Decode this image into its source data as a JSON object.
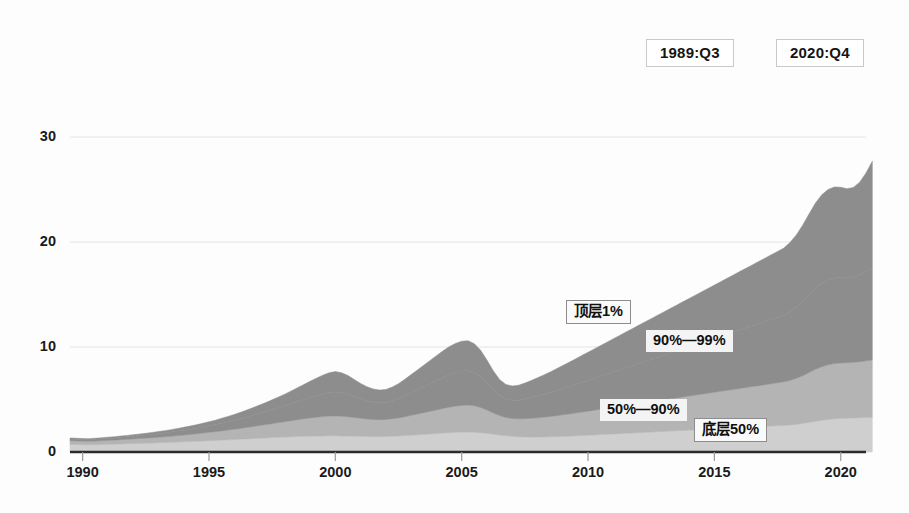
{
  "annotations": {
    "start_date": "1989:Q3",
    "end_date": "2020:Q4"
  },
  "chart_data": {
    "type": "area",
    "stacked": true,
    "title": "",
    "subtitle": "",
    "xlabel": "",
    "ylabel": "",
    "xlim": [
      1989.5,
      2021.0
    ],
    "ylim": [
      0,
      34
    ],
    "yticks": [
      0,
      10,
      20,
      30
    ],
    "ytick_labels": [
      "0",
      "10",
      "20",
      "30"
    ],
    "xticks": [
      1990,
      1995,
      2000,
      2005,
      2010,
      2015,
      2020
    ],
    "xtick_labels": [
      "1990",
      "1995",
      "2000",
      "2005",
      "2010",
      "2015",
      "2020"
    ],
    "grid": "horizontal",
    "legend_position": "inline-annotations",
    "colors": {
      "top_1": "#8d8d8d",
      "p90_99": "#8d8d8d",
      "p50_90": "#b4b4b4",
      "bottom_50": "#cfcfcf",
      "axis": "#2b2b2b",
      "grid": "#e4e4e4",
      "text": "#141414",
      "background": "#fdfdfd"
    },
    "series": [
      {
        "name": "底层50%",
        "name_en": "Bottom 50%",
        "color": "#cfcfcf",
        "label": "底层50%",
        "values": [
          0.72,
          0.71,
          0.7,
          0.69,
          0.7,
          0.72,
          0.74,
          0.75,
          0.77,
          0.79,
          0.81,
          0.82,
          0.84,
          0.86,
          0.88,
          0.9,
          0.92,
          0.95,
          0.97,
          1.0,
          1.02,
          1.05,
          1.08,
          1.1,
          1.13,
          1.16,
          1.19,
          1.22,
          1.25,
          1.28,
          1.31,
          1.34,
          1.37,
          1.4,
          1.42,
          1.45,
          1.47,
          1.49,
          1.51,
          1.52,
          1.53,
          1.54,
          1.54,
          1.53,
          1.52,
          1.5,
          1.49,
          1.48,
          1.47,
          1.47,
          1.48,
          1.5,
          1.53,
          1.56,
          1.6,
          1.64,
          1.68,
          1.72,
          1.76,
          1.8,
          1.84,
          1.87,
          1.89,
          1.9,
          1.88,
          1.84,
          1.78,
          1.7,
          1.62,
          1.55,
          1.5,
          1.46,
          1.44,
          1.43,
          1.43,
          1.44,
          1.45,
          1.47,
          1.49,
          1.51,
          1.54,
          1.57,
          1.6,
          1.63,
          1.66,
          1.69,
          1.72,
          1.75,
          1.78,
          1.81,
          1.84,
          1.87,
          1.9,
          1.93,
          1.96,
          1.99,
          2.02,
          2.05,
          2.08,
          2.11,
          2.14,
          2.17,
          2.2,
          2.23,
          2.26,
          2.29,
          2.32,
          2.35,
          2.38,
          2.41,
          2.44,
          2.47,
          2.5,
          2.53,
          2.58,
          2.64,
          2.72,
          2.82,
          2.92,
          3.02,
          3.1,
          3.16,
          3.2,
          3.22,
          3.24,
          3.26,
          3.28,
          3.3
        ]
      },
      {
        "name": "50%—90%",
        "name_en": "50%-90%",
        "color": "#b4b4b4",
        "label": "50%—90%",
        "values": [
          0.35,
          0.34,
          0.33,
          0.33,
          0.34,
          0.35,
          0.37,
          0.38,
          0.4,
          0.42,
          0.44,
          0.46,
          0.48,
          0.5,
          0.53,
          0.55,
          0.58,
          0.61,
          0.64,
          0.67,
          0.71,
          0.75,
          0.79,
          0.83,
          0.88,
          0.93,
          0.98,
          1.03,
          1.09,
          1.15,
          1.21,
          1.27,
          1.33,
          1.4,
          1.46,
          1.53,
          1.6,
          1.67,
          1.73,
          1.79,
          1.84,
          1.88,
          1.9,
          1.88,
          1.84,
          1.78,
          1.72,
          1.67,
          1.63,
          1.61,
          1.62,
          1.66,
          1.72,
          1.8,
          1.89,
          1.98,
          2.07,
          2.16,
          2.25,
          2.34,
          2.43,
          2.5,
          2.55,
          2.57,
          2.52,
          2.4,
          2.22,
          2.02,
          1.85,
          1.74,
          1.7,
          1.7,
          1.73,
          1.78,
          1.83,
          1.88,
          1.93,
          1.99,
          2.05,
          2.11,
          2.17,
          2.23,
          2.29,
          2.35,
          2.41,
          2.47,
          2.53,
          2.59,
          2.65,
          2.71,
          2.77,
          2.83,
          2.89,
          2.95,
          3.01,
          3.07,
          3.13,
          3.19,
          3.25,
          3.31,
          3.37,
          3.43,
          3.49,
          3.55,
          3.61,
          3.67,
          3.73,
          3.79,
          3.85,
          3.91,
          3.97,
          4.03,
          4.09,
          4.15,
          4.25,
          4.38,
          4.55,
          4.75,
          4.95,
          5.1,
          5.2,
          5.26,
          5.28,
          5.28,
          5.3,
          5.34,
          5.4,
          5.46
        ]
      },
      {
        "name": "90%—99%",
        "name_en": "90%-99%",
        "color": "#8d8d8d",
        "label": "90%—99%",
        "values": [
          0.18,
          0.17,
          0.17,
          0.17,
          0.18,
          0.19,
          0.2,
          0.21,
          0.23,
          0.24,
          0.26,
          0.28,
          0.3,
          0.32,
          0.35,
          0.37,
          0.4,
          0.43,
          0.47,
          0.5,
          0.54,
          0.58,
          0.63,
          0.68,
          0.74,
          0.8,
          0.86,
          0.93,
          1.0,
          1.08,
          1.16,
          1.24,
          1.33,
          1.42,
          1.52,
          1.62,
          1.73,
          1.84,
          1.95,
          2.06,
          2.16,
          2.24,
          2.28,
          2.24,
          2.14,
          2.0,
          1.86,
          1.74,
          1.66,
          1.62,
          1.64,
          1.72,
          1.84,
          1.99,
          2.15,
          2.31,
          2.47,
          2.63,
          2.79,
          2.95,
          3.09,
          3.2,
          3.27,
          3.28,
          3.18,
          2.95,
          2.6,
          2.22,
          1.92,
          1.76,
          1.73,
          1.78,
          1.87,
          1.97,
          2.07,
          2.17,
          2.27,
          2.38,
          2.49,
          2.6,
          2.71,
          2.82,
          2.93,
          3.04,
          3.15,
          3.26,
          3.37,
          3.48,
          3.59,
          3.7,
          3.81,
          3.92,
          4.03,
          4.14,
          4.25,
          4.36,
          4.47,
          4.58,
          4.69,
          4.8,
          4.91,
          5.02,
          5.13,
          5.24,
          5.35,
          5.46,
          5.57,
          5.68,
          5.79,
          5.9,
          6.01,
          6.12,
          6.23,
          6.34,
          6.52,
          6.76,
          7.06,
          7.4,
          7.72,
          7.96,
          8.1,
          8.16,
          8.14,
          8.08,
          8.1,
          8.25,
          8.5,
          8.78
        ]
      },
      {
        "name": "顶层1%",
        "name_en": "Top 1%",
        "color": "#8d8d8d",
        "label": "顶层1%",
        "values": [
          0.09,
          0.09,
          0.08,
          0.08,
          0.09,
          0.1,
          0.1,
          0.11,
          0.12,
          0.13,
          0.14,
          0.15,
          0.16,
          0.18,
          0.19,
          0.21,
          0.23,
          0.25,
          0.27,
          0.3,
          0.32,
          0.35,
          0.38,
          0.42,
          0.46,
          0.5,
          0.55,
          0.6,
          0.66,
          0.72,
          0.79,
          0.86,
          0.94,
          1.02,
          1.11,
          1.21,
          1.31,
          1.42,
          1.54,
          1.66,
          1.78,
          1.88,
          1.94,
          1.9,
          1.78,
          1.62,
          1.46,
          1.33,
          1.24,
          1.2,
          1.22,
          1.3,
          1.42,
          1.57,
          1.73,
          1.89,
          2.05,
          2.21,
          2.37,
          2.52,
          2.66,
          2.77,
          2.84,
          2.85,
          2.74,
          2.5,
          2.16,
          1.8,
          1.52,
          1.38,
          1.36,
          1.42,
          1.52,
          1.63,
          1.74,
          1.85,
          1.96,
          2.08,
          2.2,
          2.32,
          2.44,
          2.56,
          2.68,
          2.8,
          2.92,
          3.04,
          3.16,
          3.28,
          3.4,
          3.52,
          3.64,
          3.76,
          3.88,
          4.0,
          4.12,
          4.24,
          4.36,
          4.48,
          4.6,
          4.72,
          4.84,
          4.96,
          5.08,
          5.2,
          5.32,
          5.44,
          5.56,
          5.68,
          5.8,
          5.92,
          6.04,
          6.16,
          6.28,
          6.4,
          6.62,
          6.92,
          7.3,
          7.72,
          8.12,
          8.42,
          8.6,
          8.66,
          8.6,
          8.5,
          8.56,
          8.85,
          9.4,
          10.15
        ]
      }
    ],
    "x_start": 1989.5,
    "x_step": 0.25,
    "n_points": 128,
    "total_last_value": 26.7,
    "peak_value": 33.0
  },
  "series_labels": {
    "top1": "顶层1%",
    "p90_99": "90%—99%",
    "p50_90": "50%—90%",
    "bottom50": "底层50%"
  }
}
